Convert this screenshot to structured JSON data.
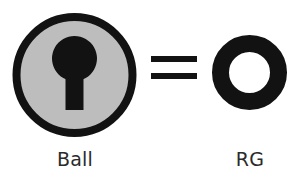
{
  "figure": {
    "kind": "equivalence-diagram",
    "background_color": "#ffffff",
    "relation_symbol": "=",
    "left": {
      "label": "Ball",
      "icon_name": "keyhole-disc-icon",
      "disc_fill_color": "#bdbdbd",
      "disc_outline_color": "#121212",
      "keyhole_color": "#121212",
      "disc_outline_width_px": 8,
      "disc_diameter_px": 123
    },
    "middle": {
      "icon_name": "equals-icon",
      "bar_color": "#121212",
      "bar_count": 2,
      "bar_width_px": 46,
      "bar_height_px": 6
    },
    "right": {
      "label": "RG",
      "icon_name": "ring-annulus-icon",
      "ring_color": "#121212",
      "ring_outer_diameter_px": 75,
      "ring_stroke_px": 17
    }
  }
}
